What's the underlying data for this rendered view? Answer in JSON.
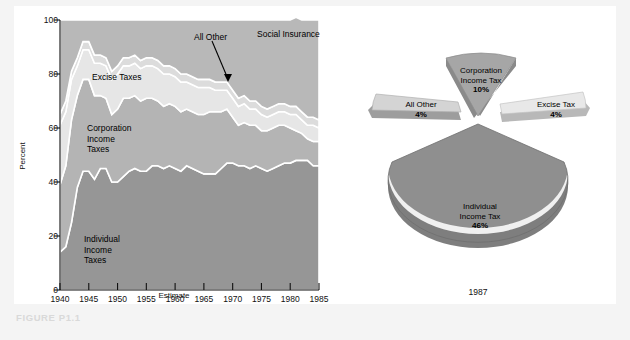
{
  "figure": {
    "caption": "FIGURE P1.1"
  },
  "area_chart_labels": {
    "individual": "Individual\nIncome\nTaxes",
    "individual_l1": "Individual",
    "individual_l2": "Income",
    "individual_l3": "Taxes",
    "corporation_l1": "Corporation",
    "corporation_l2": "Income",
    "corporation_l3": "Taxes",
    "excise": "Excise Taxes",
    "all_other": "All Other",
    "social_insurance": "Social Insurance"
  },
  "pie_labels": {
    "all_other_name": "All  Other",
    "all_other_pct": "4%",
    "corporation_l1": "Corporation",
    "corporation_l2": "Income Tax",
    "corporation_pct": "10%",
    "excise_name": "Excise  Tax",
    "excise_pct": "4%",
    "individual_l1": "Individual",
    "individual_l2": "Income  Tax",
    "individual_pct": "46%",
    "year": "1987"
  },
  "chart_data": [
    {
      "type": "area",
      "title": "",
      "xlabel": "Estimate",
      "ylabel": "Percent",
      "ylim": [
        0,
        100
      ],
      "xlim": [
        1940,
        1985
      ],
      "grid": false,
      "stacked": true,
      "legend": "in-plot annotations",
      "yticks": [
        0,
        20,
        40,
        60,
        80,
        100
      ],
      "xticks": [
        1940,
        1945,
        1950,
        1955,
        1960,
        1965,
        1970,
        1975,
        1980,
        1985
      ],
      "x": [
        1940,
        1941,
        1942,
        1943,
        1944,
        1945,
        1946,
        1947,
        1948,
        1949,
        1950,
        1951,
        1952,
        1953,
        1954,
        1955,
        1956,
        1957,
        1958,
        1959,
        1960,
        1961,
        1962,
        1963,
        1964,
        1965,
        1966,
        1967,
        1968,
        1969,
        1970,
        1971,
        1972,
        1973,
        1974,
        1975,
        1976,
        1977,
        1978,
        1979,
        1980,
        1981,
        1982,
        1983,
        1984,
        1985
      ],
      "series": [
        {
          "name": "Individual Income Taxes",
          "color": "#969696",
          "values": [
            14,
            16,
            25,
            38,
            44,
            44,
            41,
            45,
            45,
            40,
            40,
            42,
            44,
            45,
            44,
            44,
            46,
            46,
            45,
            46,
            45,
            44,
            46,
            45,
            44,
            43,
            43,
            43,
            45,
            47,
            47,
            46,
            46,
            45,
            46,
            45,
            44,
            45,
            46,
            47,
            47,
            48,
            48,
            48,
            46,
            46
          ]
        },
        {
          "name": "Corporation Income Taxes",
          "color": "#b4b4b4",
          "values": [
            25,
            30,
            38,
            34,
            34,
            34,
            31,
            27,
            26,
            25,
            27,
            29,
            27,
            27,
            26,
            27,
            25,
            24,
            23,
            23,
            23,
            22,
            21,
            21,
            21,
            22,
            23,
            23,
            21,
            20,
            17,
            15,
            16,
            16,
            15,
            14,
            15,
            15,
            15,
            14,
            13,
            11,
            10,
            8,
            9,
            9
          ]
        },
        {
          "name": "Excise Taxes",
          "color": "#e6e6e6",
          "values": [
            22,
            20,
            15,
            11,
            11,
            11,
            12,
            12,
            12,
            13,
            13,
            12,
            12,
            12,
            12,
            12,
            12,
            12,
            12,
            11,
            11,
            11,
            10,
            10,
            10,
            10,
            9,
            8,
            8,
            7,
            7,
            7,
            7,
            6,
            6,
            6,
            5,
            5,
            5,
            5,
            5,
            6,
            5,
            5,
            6,
            5
          ]
        },
        {
          "name": "All Other",
          "color": "#dcdcdc",
          "values": [
            4,
            4,
            3,
            3,
            3,
            3,
            3,
            3,
            3,
            3,
            3,
            3,
            3,
            3,
            3,
            3,
            3,
            3,
            3,
            3,
            3,
            3,
            3,
            3,
            3,
            3,
            3,
            3,
            3,
            3,
            3,
            3,
            3,
            3,
            3,
            3,
            3,
            3,
            3,
            3,
            3,
            3,
            3,
            3,
            3,
            3
          ]
        },
        {
          "name": "Social Insurance",
          "color": "#b8b8b8",
          "values": [
            35,
            30,
            19,
            14,
            8,
            8,
            13,
            13,
            14,
            19,
            17,
            14,
            14,
            13,
            15,
            14,
            14,
            15,
            17,
            17,
            18,
            20,
            20,
            21,
            22,
            22,
            22,
            23,
            23,
            23,
            26,
            29,
            28,
            30,
            30,
            32,
            33,
            32,
            31,
            31,
            32,
            33,
            34,
            36,
            36,
            37
          ]
        }
      ]
    },
    {
      "type": "pie",
      "title": "1987",
      "exploded": true,
      "three_d": true,
      "labels": [
        "Individual Income Tax",
        "All Other",
        "Corporation Income Tax",
        "Excise Tax",
        "Social Insurance"
      ],
      "values": [
        46,
        4,
        10,
        4,
        36
      ],
      "labeled_values": [
        46,
        4,
        10,
        4
      ],
      "colors": [
        "#9a9a9a",
        "#d2d2d2",
        "#a8a8a8",
        "#e4e4e4",
        "#9a9a9a"
      ]
    }
  ]
}
